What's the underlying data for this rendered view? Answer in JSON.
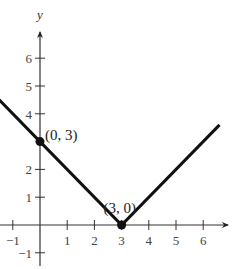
{
  "chart_data": {
    "type": "line",
    "title": "",
    "function": "y = |x - 3|",
    "xlabel": "",
    "ylabel": "y",
    "xlim": [
      -1.5,
      6.8
    ],
    "ylim": [
      -1.2,
      7
    ],
    "grid": false,
    "x_ticks": [
      -1,
      1,
      2,
      3,
      4,
      5,
      6
    ],
    "y_ticks": [
      -1,
      1,
      2,
      4,
      5,
      6
    ],
    "x_tick_labels": [
      "−1",
      "1",
      "2",
      "3",
      "4",
      "5",
      "6"
    ],
    "y_tick_labels": [
      "−1",
      "1",
      "2",
      "4",
      "5",
      "6"
    ],
    "series": [
      {
        "name": "y = |x - 3|",
        "x": [
          -1.5,
          0,
          3,
          6.6
        ],
        "y": [
          4.5,
          3,
          0,
          3.6
        ],
        "color": "#111111"
      }
    ],
    "points": [
      {
        "x": 0,
        "y": 3,
        "label": "(0, 3)"
      },
      {
        "x": 3,
        "y": 0,
        "label": "(3, 0)"
      }
    ]
  }
}
